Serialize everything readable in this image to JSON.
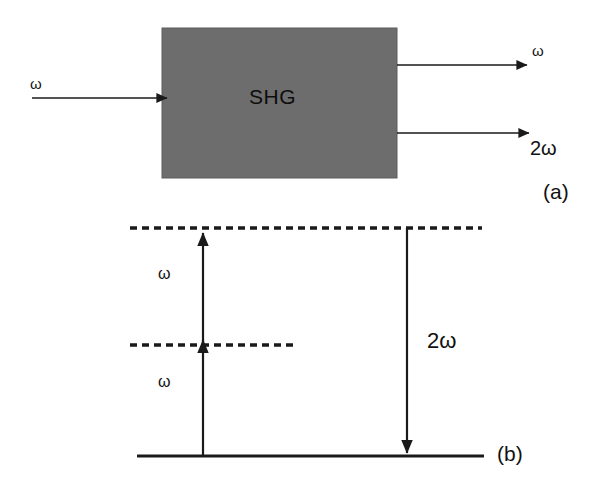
{
  "figure": {
    "background_color": "#ffffff",
    "line_color": "#1a1a1a",
    "box_fill_color": "#6d6d6d"
  },
  "panel_a": {
    "caption": "(a)",
    "block_label": "SHG",
    "input_beam_label": "ω",
    "output_fundamental_label": "ω",
    "output_second_harmonic_label": "2ω"
  },
  "panel_b": {
    "caption": "(b)",
    "transition_up_lower_label": "ω",
    "transition_up_upper_label": "ω",
    "transition_down_label": "2ω",
    "level_ground": "ground state line",
    "level_virtual_1": "virtual level 1 (dashed)",
    "level_virtual_2": "virtual level 2 (dashed)"
  }
}
